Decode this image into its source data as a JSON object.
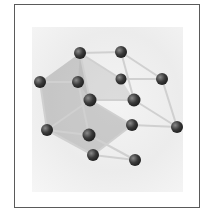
{
  "figure": {
    "colors": {
      "frame": "#5a5a5a",
      "ball": "#3a3a3a",
      "stick": "#d8d8d8",
      "plane": "#9a9a9a"
    },
    "atoms": [
      {
        "x": 80,
        "y": 53
      },
      {
        "x": 121,
        "y": 52
      },
      {
        "x": 40,
        "y": 82
      },
      {
        "x": 78,
        "y": 82
      },
      {
        "x": 121,
        "y": 79
      },
      {
        "x": 162,
        "y": 79
      },
      {
        "x": 90,
        "y": 100
      },
      {
        "x": 134,
        "y": 100
      },
      {
        "x": 47,
        "y": 130
      },
      {
        "x": 89,
        "y": 135
      },
      {
        "x": 132,
        "y": 125
      },
      {
        "x": 177,
        "y": 127
      },
      {
        "x": 93,
        "y": 155
      },
      {
        "x": 135,
        "y": 160
      }
    ]
  }
}
